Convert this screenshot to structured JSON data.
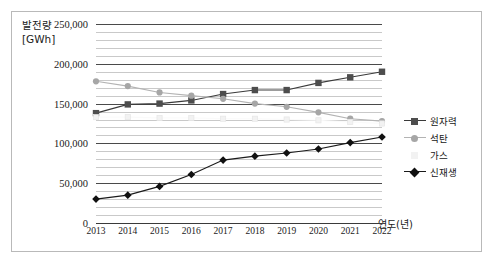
{
  "axis": {
    "y_title_line1": "발전량",
    "y_title_line2": "[GWh]",
    "x_title": "연도(년)"
  },
  "legend": {
    "items": [
      {
        "label": "원자력",
        "marker": "square-marker",
        "color": "#4d4d4d",
        "line": "#3a3a3a"
      },
      {
        "label": "석탄",
        "marker": "circle-marker",
        "color": "#a6a6a6",
        "line": "#b3b3b3"
      },
      {
        "label": "가스",
        "marker": "blank-marker",
        "color": "#f2f2f2",
        "line": "#fafafa"
      },
      {
        "label": "신재생",
        "marker": "diamond-marker",
        "color": "#111111",
        "line": "#1a1a1a"
      }
    ]
  },
  "chart_data": {
    "type": "line",
    "title": "",
    "xlabel": "연도(년)",
    "ylabel": "발전량 [GWh]",
    "x": [
      2013,
      2014,
      2015,
      2016,
      2017,
      2018,
      2019,
      2020,
      2021,
      2022
    ],
    "categories": [
      "2013",
      "2014",
      "2015",
      "2016",
      "2017",
      "2018",
      "2019",
      "2020",
      "2021",
      "2022"
    ],
    "ylim": [
      0,
      250000
    ],
    "ytick_labels": [
      "0",
      "50,000",
      "100,000",
      "150,000",
      "200,000",
      "250,000"
    ],
    "ytick_values": [
      0,
      50000,
      100000,
      150000,
      200000,
      250000
    ],
    "minor_gridline_step": 10000,
    "grid": true,
    "legend_position": "right",
    "series": [
      {
        "name": "원자력",
        "marker": "square",
        "values": [
          138000,
          149000,
          150000,
          154000,
          162000,
          167000,
          167000,
          176000,
          183000,
          190000
        ]
      },
      {
        "name": "석탄",
        "marker": "circle",
        "values": [
          178000,
          172000,
          164000,
          160000,
          156000,
          150000,
          146000,
          139000,
          131000,
          128000
        ]
      },
      {
        "name": "가스",
        "marker": "blank",
        "values": [
          133000,
          133000,
          132000,
          132000,
          131000,
          131000,
          130000,
          129000,
          127000,
          125000
        ]
      },
      {
        "name": "신재생",
        "marker": "diamond",
        "values": [
          30000,
          35000,
          46000,
          61000,
          79000,
          84000,
          88000,
          93000,
          101000,
          108000
        ]
      }
    ]
  }
}
